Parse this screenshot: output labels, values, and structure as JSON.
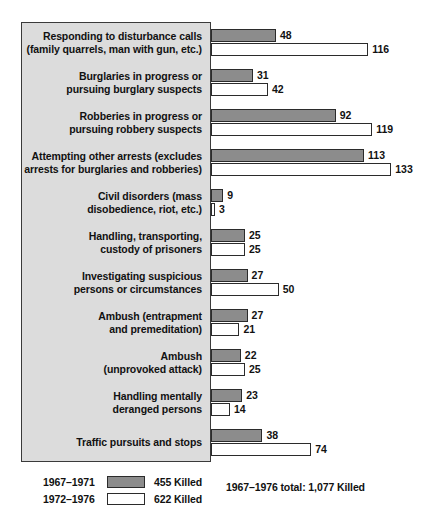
{
  "chart_data": {
    "type": "bar",
    "orientation": "horizontal",
    "title": "",
    "xlabel": "",
    "ylabel": "",
    "xlim": [
      0,
      140
    ],
    "grid": false,
    "legend_position": "bottom-left",
    "categories": [
      "Responding to disturbance calls\n(family quarrels, man with gun, etc.)",
      "Burglaries in progress or\npursuing burglary suspects",
      "Robberies in progress or\npursuing robbery suspects",
      "Attempting other arrests (excludes\narrests for burglaries and robberies)",
      "Civil disorders (mass\ndisobedience, riot, etc.)",
      "Handling, transporting,\ncustody of prisoners",
      "Investigating suspicious\npersons or circumstances",
      "Ambush (entrapment\nand premeditation)",
      "Ambush\n(unprovoked attack)",
      "Handling mentally\nderanged persons",
      "Traffic pursuits and stops"
    ],
    "series": [
      {
        "name": "1967-1971",
        "color": "#8c8c8c",
        "total_label": "455 Killed",
        "values": [
          48,
          31,
          92,
          113,
          9,
          25,
          27,
          27,
          22,
          23,
          38
        ]
      },
      {
        "name": "1972-1976",
        "color": "#ffffff",
        "total_label": "622 Killed",
        "values": [
          116,
          42,
          119,
          133,
          3,
          25,
          50,
          21,
          25,
          14,
          74
        ]
      }
    ],
    "annotations": [
      "1967–1976 total: 1,077 Killed"
    ]
  },
  "rows": [
    {
      "label_line1": "Responding to disturbance calls",
      "label_line2": "(family quarrels, man with gun, etc.)",
      "a": 48,
      "b": 116
    },
    {
      "label_line1": "Burglaries in progress or",
      "label_line2": "pursuing burglary suspects",
      "a": 31,
      "b": 42
    },
    {
      "label_line1": "Robberies in progress or",
      "label_line2": "pursuing robbery suspects",
      "a": 92,
      "b": 119
    },
    {
      "label_line1": "Attempting other arrests (excludes",
      "label_line2": "arrests for burglaries and robberies)",
      "a": 113,
      "b": 133
    },
    {
      "label_line1": "Civil disorders (mass",
      "label_line2": "disobedience, riot, etc.)",
      "a": 9,
      "b": 3
    },
    {
      "label_line1": "Handling, transporting,",
      "label_line2": "custody of prisoners",
      "a": 25,
      "b": 25
    },
    {
      "label_line1": "Investigating suspicious",
      "label_line2": "persons or circumstances",
      "a": 27,
      "b": 50
    },
    {
      "label_line1": "Ambush (entrapment",
      "label_line2": "and premeditation)",
      "a": 27,
      "b": 21
    },
    {
      "label_line1": "Ambush",
      "label_line2": "(unprovoked attack)",
      "a": 22,
      "b": 25
    },
    {
      "label_line1": "Handling mentally",
      "label_line2": "deranged persons",
      "a": 23,
      "b": 14
    },
    {
      "label_line1": "Traffic pursuits and stops",
      "label_line2": "",
      "a": 38,
      "b": 74
    }
  ],
  "legend": {
    "series_a_period": "1967–1971",
    "series_a_total": "455 Killed",
    "series_b_period": "1972–1976",
    "series_b_total": "622 Killed"
  },
  "total_note": "1967–1976 total: 1,077 Killed",
  "colors": {
    "series_a": "#8c8c8c",
    "series_b": "#ffffff",
    "panel_bg": "#dcdcdc",
    "outline": "#2b2b2b"
  }
}
